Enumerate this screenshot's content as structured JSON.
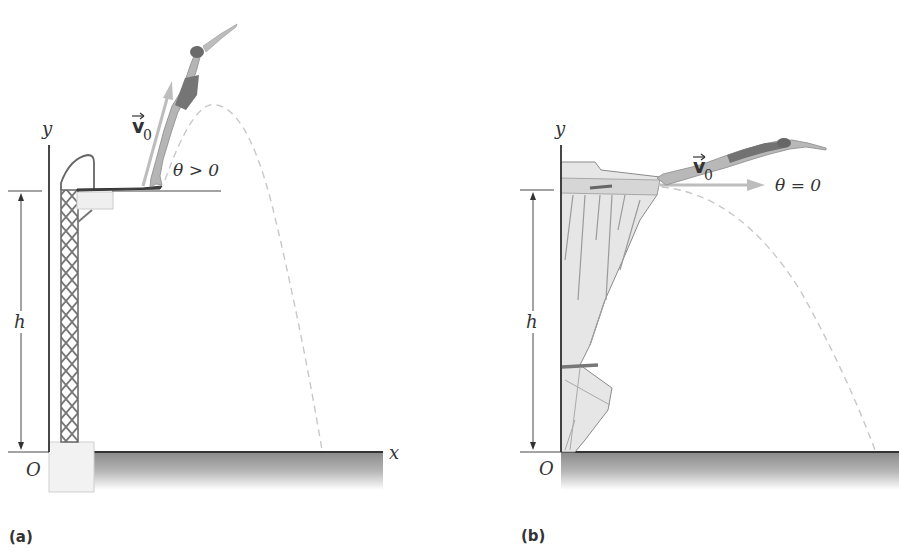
{
  "figure": {
    "panels": [
      {
        "id": "a",
        "caption": "(a)",
        "scene": "diving board",
        "axis_y_label": "y",
        "axis_x_label": "x",
        "origin_label": "O",
        "height_label": "h",
        "velocity_label": "v",
        "velocity_subscript": "0",
        "angle_label": "θ > 0"
      },
      {
        "id": "b",
        "caption": "(b)",
        "scene": "cliff",
        "axis_y_label": "y",
        "origin_label": "O",
        "height_label": "h",
        "velocity_label": "v",
        "velocity_subscript": "0",
        "angle_label": "θ = 0"
      }
    ],
    "colors": {
      "axis": "#333333",
      "trajectory": "#c8c8c8",
      "velocity_arrow": "#bdbdbd",
      "ground": "#8c8c8c",
      "diver_suit": "#6e6e6e",
      "diver_skin": "#b8b8b8",
      "tower": "#6a6a6a",
      "cliff": "#e2e2e2"
    }
  }
}
